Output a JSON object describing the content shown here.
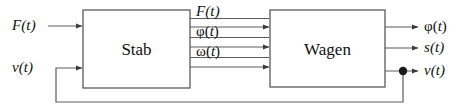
{
  "diagram": {
    "type": "block-diagram",
    "background_color": "#ffffff",
    "line_color": "#4d4d4d",
    "box_border_color": "#5a5a5a",
    "box_fill_color": "#ffffff",
    "text_color": "#111111"
  },
  "blocks": [
    {
      "id": "stab",
      "label": "Stab",
      "x": 83,
      "y": 10,
      "width": 107,
      "height": 78
    },
    {
      "id": "wagen",
      "label": "Wagen",
      "x": 270,
      "y": 10,
      "width": 115,
      "height": 77
    }
  ],
  "inputs": [
    {
      "id": "in-force",
      "label": "F(t)",
      "greek": false,
      "target": "stab",
      "y": 26
    },
    {
      "id": "in-velocity",
      "label": "v(t)",
      "greek": false,
      "target": "stab",
      "y": 68,
      "source": "feedback"
    }
  ],
  "intermediate": [
    {
      "id": "mid-force",
      "label": "F(t)",
      "greek": false,
      "from": "stab",
      "to": "wagen",
      "y": 27
    },
    {
      "id": "mid-phi",
      "label": "φ(t)",
      "greek": true,
      "from": "stab",
      "to": "wagen",
      "y": 47
    },
    {
      "id": "mid-omega",
      "label": "ω(t)",
      "greek": true,
      "from": "stab",
      "to": "wagen",
      "y": 67
    }
  ],
  "outputs": [
    {
      "id": "out-phi",
      "label": "φ(t)",
      "greek": true,
      "from": "wagen",
      "y": 27
    },
    {
      "id": "out-position",
      "label": "s(t)",
      "greek": false,
      "from": "wagen",
      "y": 48
    },
    {
      "id": "out-velocity",
      "label": "v(t)",
      "greek": false,
      "from": "wagen",
      "y": 71,
      "has_junction": true
    }
  ],
  "feedback": {
    "id": "velocity-feedback",
    "from_signal": "out-velocity",
    "to_input": "in-velocity",
    "junction_x": 403,
    "junction_y": 71,
    "bottom_y": 102,
    "left_x": 56
  },
  "labels": {
    "in_force": "F(t)",
    "in_velocity": "v(t)",
    "mid_force": "F(t)",
    "mid_phi": "φ(t)",
    "mid_omega": "ω(t)",
    "out_phi": "φ(t)",
    "out_position": "s(t)",
    "out_velocity": "v(t)",
    "block_stab": "Stab",
    "block_wagen": "Wagen"
  },
  "glyph_parts": {
    "phi": "φ",
    "omega": "ω",
    "paren_open": "(",
    "paren_close": ")",
    "t": "t"
  }
}
